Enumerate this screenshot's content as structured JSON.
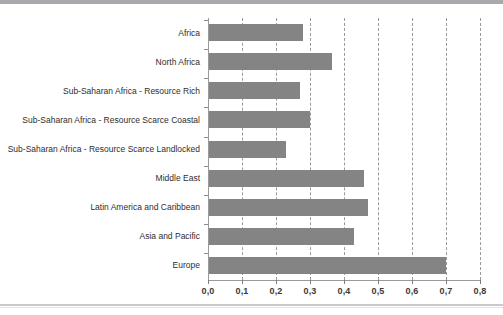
{
  "chart_data": {
    "type": "bar",
    "orientation": "horizontal",
    "title": "",
    "subtitle": "",
    "xlabel": "",
    "ylabel": "",
    "xlim": [
      0.0,
      0.8
    ],
    "grid": true,
    "grid_style": "dashed vertical",
    "legend": null,
    "bar_color": "#848484",
    "axis_color": "#9a9a9a",
    "categories": [
      "Africa",
      "North Africa",
      "Sub-Saharan Africa - Resource Rich",
      "Sub-Saharan Africa - Resource Scarce Coastal",
      "Sub-Saharan Africa - Resource Scarce Landlocked",
      "Middle East",
      "Latin America and Caribbean",
      "Asia and Pacific",
      "Europe"
    ],
    "values": [
      0.28,
      0.365,
      0.27,
      0.3,
      0.23,
      0.46,
      0.47,
      0.43,
      0.7
    ],
    "x_tick_values": [
      0.0,
      0.1,
      0.2,
      0.3,
      0.4,
      0.5,
      0.6,
      0.7,
      0.8
    ],
    "x_tick_labels": [
      "0,0",
      "0,1",
      "0,2",
      "0,3",
      "0,4",
      "0,5",
      "0,6",
      "0,7",
      "0,8"
    ]
  }
}
